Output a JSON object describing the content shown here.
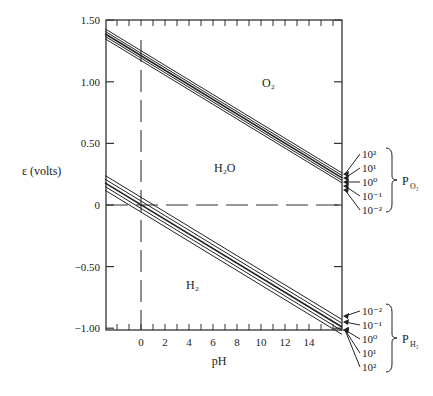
{
  "chart_data": {
    "type": "line",
    "title": "",
    "xlabel": "pH",
    "ylabel": "ε (volts)",
    "xlim": [
      -3,
      16.75
    ],
    "ylim": [
      -1.0,
      1.5
    ],
    "x_ticks": [
      0,
      2,
      4,
      6,
      8,
      10,
      12,
      14
    ],
    "x_tick_labels": [
      "0",
      "2",
      "4",
      "6",
      "8",
      "10",
      "12",
      "14"
    ],
    "y_ticks": [
      1.5,
      1.0,
      0.5,
      0,
      -0.5,
      -1.0
    ],
    "y_tick_labels": [
      "1.50",
      "1.00",
      "0.50",
      "0",
      "−0.50",
      "−1.00"
    ],
    "region_labels": {
      "o2": "O₂",
      "h2o": "H₂O",
      "h2": "H₂"
    },
    "reference_lines": {
      "vertical_dashed_at_pH": 0,
      "horizontal_dashed_at_volts": 0
    },
    "o2_group": {
      "label": "P_O2",
      "pressures": [
        "10²",
        "10¹",
        "10⁰",
        "10⁻¹",
        "10⁻²"
      ],
      "series": [
        {
          "name": "P_O2 = 10^2",
          "x": [
            -3,
            16.75
          ],
          "y": [
            1.43,
            0.26
          ]
        },
        {
          "name": "P_O2 = 10^1",
          "x": [
            -3,
            16.75
          ],
          "y": [
            1.41,
            0.24
          ]
        },
        {
          "name": "P_O2 = 10^0",
          "x": [
            -3,
            16.75
          ],
          "y": [
            1.39,
            0.22
          ]
        },
        {
          "name": "P_O2 = 10^-1",
          "x": [
            -3,
            16.75
          ],
          "y": [
            1.37,
            0.2
          ]
        },
        {
          "name": "P_O2 = 10^-2",
          "x": [
            -3,
            16.75
          ],
          "y": [
            1.35,
            0.18
          ]
        }
      ]
    },
    "h2_group": {
      "label": "P_H2",
      "pressures": [
        "10⁻²",
        "10⁻¹",
        "10⁰",
        "10¹",
        "10²"
      ],
      "series": [
        {
          "name": "P_H2 = 10^-2",
          "x": [
            -3,
            16.75
          ],
          "y": [
            0.24,
            -0.93
          ]
        },
        {
          "name": "P_H2 = 10^-1",
          "x": [
            -3,
            16.75
          ],
          "y": [
            0.21,
            -0.96
          ]
        },
        {
          "name": "P_H2 = 10^0",
          "x": [
            -3,
            16.75
          ],
          "y": [
            0.18,
            -0.99
          ]
        },
        {
          "name": "P_H2 = 10^1",
          "x": [
            -3,
            16.75
          ],
          "y": [
            0.15,
            -1.02
          ]
        },
        {
          "name": "P_H2 = 10^2",
          "x": [
            -3,
            16.75
          ],
          "y": [
            0.12,
            -1.05
          ]
        }
      ]
    },
    "grid": false,
    "legend_position": "right (bracketed annotations)"
  }
}
